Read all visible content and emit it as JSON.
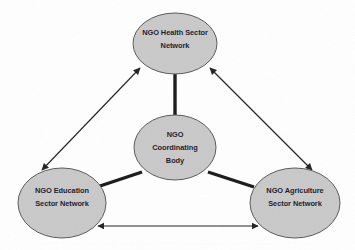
{
  "diagram": {
    "type": "hub-and-spoke network diagram",
    "background_color": "#ffffff",
    "node_fill_color": "#c9c9c9",
    "node_stroke_color": "#595959",
    "spoke_link_color": "#1a1a1a",
    "peer_link_color": "#232323",
    "label_color": "#1a1a2e",
    "nodes": [
      {
        "id": "health",
        "role": "sector-network",
        "lines": [
          "NGO Health Sector",
          "Network"
        ],
        "cx": 175,
        "cy": 43.5,
        "rx": 42,
        "ry": 30.5
      },
      {
        "id": "coordinating",
        "role": "hub",
        "lines": [
          "NGO",
          "Coordinating",
          "Body"
        ],
        "cx": 175,
        "cy": 147.5,
        "rx": 41,
        "ry": 32.5
      },
      {
        "id": "education",
        "role": "sector-network",
        "lines": [
          "NGO Education",
          "Sector Network"
        ],
        "cx": 62,
        "cy": 203,
        "rx": 44,
        "ry": 35
      },
      {
        "id": "agriculture",
        "role": "sector-network",
        "lines": [
          "NGO Agriculture",
          "Sector Network"
        ],
        "cx": 295,
        "cy": 203,
        "rx": 45,
        "ry": 35
      }
    ],
    "links": [
      {
        "id": "hub-to-health",
        "from": "coordinating",
        "to": "health",
        "style": "thick-plain",
        "arrowheads": "none"
      },
      {
        "id": "hub-to-education",
        "from": "coordinating",
        "to": "education",
        "style": "thick-plain",
        "arrowheads": "none"
      },
      {
        "id": "hub-to-agriculture",
        "from": "coordinating",
        "to": "agriculture",
        "style": "thick-plain",
        "arrowheads": "none"
      },
      {
        "id": "health-education",
        "from": "health",
        "to": "education",
        "style": "thin-arrow",
        "arrowheads": "both"
      },
      {
        "id": "health-agriculture",
        "from": "health",
        "to": "agriculture",
        "style": "thin-arrow",
        "arrowheads": "both"
      },
      {
        "id": "education-agriculture",
        "from": "education",
        "to": "agriculture",
        "style": "thin-arrow",
        "arrowheads": "both"
      }
    ]
  }
}
